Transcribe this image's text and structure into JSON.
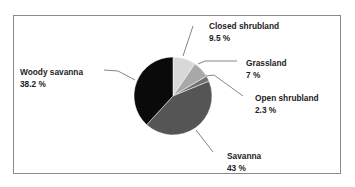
{
  "chart_data": {
    "type": "pie",
    "title": "",
    "categories": [
      "Closed shrubland",
      "Grassland",
      "Open shrubland",
      "Savanna",
      "Woody savanna"
    ],
    "values": [
      9.5,
      7,
      2.3,
      43,
      38.2
    ],
    "colors": [
      "#d8d8d8",
      "#a8a8a8",
      "#707070",
      "#555555",
      "#0a0a0a"
    ],
    "labels": [
      {
        "name": "Closed shrubland",
        "value": "9.5 %"
      },
      {
        "name": "Grassland",
        "value": "7 %"
      },
      {
        "name": "Open shrubland",
        "value": "2.3 %"
      },
      {
        "name": "Savanna",
        "value": "43 %"
      },
      {
        "name": "Woody savanna",
        "value": "38.2 %"
      }
    ],
    "legend": "none (callout labels)"
  }
}
